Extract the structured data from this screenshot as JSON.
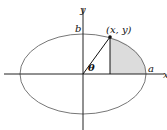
{
  "diagram": {
    "type": "ellipse-parametric",
    "labels": {
      "x_axis": "x",
      "y_axis": "y",
      "semi_minor": "b",
      "semi_major": "a",
      "point": "(x, y)",
      "angle": "θ"
    },
    "colors": {
      "ellipse_stroke": "#777777",
      "axis": "#222222",
      "shade": "#dcdcdc",
      "line": "#111111"
    }
  }
}
